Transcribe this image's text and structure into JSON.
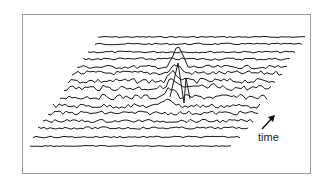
{
  "figure": {
    "type": "waterfall-plot",
    "annotation": {
      "label": "time",
      "arrow": "arrow-up-right"
    },
    "trace_count": 15,
    "colors": {
      "line": "#1a1a1a",
      "frame": "#9a9a9a",
      "background": "#ffffff"
    }
  }
}
